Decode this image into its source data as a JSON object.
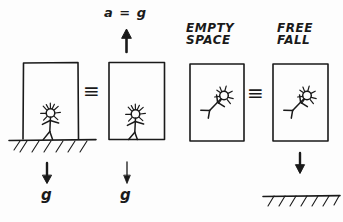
{
  "diagram": {
    "ink_color": "#1a1a1a",
    "background_color": "#fdfdfd",
    "labels": {
      "acceleration": "a = g",
      "empty_space_line1": "EMPTY",
      "empty_space_line2": "SPACE",
      "free_fall_line1": "FREE",
      "free_fall_line2": "FALL",
      "gravity_left": "g",
      "gravity_middle": "g",
      "equivalence_sign_1": "≡",
      "equivalence_sign_2": "≡"
    },
    "panels": [
      {
        "name": "box-on-ground",
        "state": "at rest on ground",
        "figure_pose": "standing",
        "box_open_bottom": true,
        "ground": true,
        "arrow": "down",
        "arrow_label": "g"
      },
      {
        "name": "accelerating-box",
        "state": "accelerating upward",
        "figure_pose": "standing",
        "box_open_bottom": false,
        "ground": false,
        "arrow": "up",
        "arrow_label": "a = g",
        "bottom_arrow": "down",
        "bottom_arrow_label": "g"
      },
      {
        "name": "empty-space-box",
        "state": "EMPTY SPACE",
        "figure_pose": "floating tilted",
        "box_open_bottom": false,
        "ground": false,
        "arrow": "none"
      },
      {
        "name": "free-fall-box",
        "state": "FREE FALL",
        "figure_pose": "floating tilted",
        "box_open_bottom": false,
        "ground": true,
        "arrow": "down",
        "arrow_label": ""
      }
    ]
  }
}
